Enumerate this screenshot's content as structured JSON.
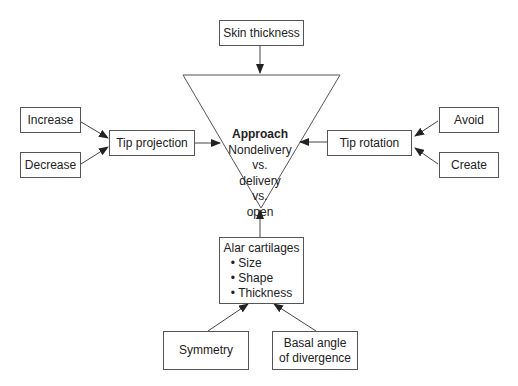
{
  "diagram": {
    "center": {
      "title": "Approach",
      "lines": [
        "Nondelivery",
        "vs.",
        "delivery",
        "vs.",
        "open"
      ]
    },
    "top": {
      "label": "Skin thickness"
    },
    "left": {
      "label": "Tip projection",
      "inputs": [
        "Increase",
        "Decrease"
      ]
    },
    "right": {
      "label": "Tip rotation",
      "inputs": [
        "Avoid",
        "Create"
      ]
    },
    "bottom": {
      "label": "Alar cartilages",
      "bullets": [
        "Size",
        "Shape",
        "Thickness"
      ],
      "inputs": [
        "Symmetry",
        "Basal angle",
        "of divergence"
      ]
    }
  }
}
